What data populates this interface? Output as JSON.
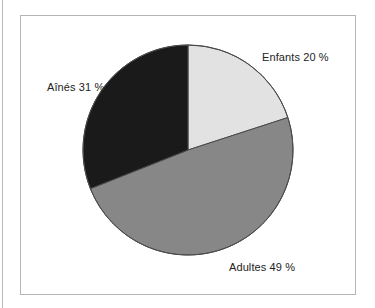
{
  "figure": {
    "frame_color": "#b5b5b5",
    "background_color": "#ffffff"
  },
  "chart_data": {
    "type": "pie",
    "title": "",
    "subtitle": "",
    "xlabel": "",
    "ylabel": "",
    "legend_position": "none",
    "grid": false,
    "units": "%",
    "start_angle_deg": 0,
    "direction": "clockwise",
    "center": {
      "x": 188,
      "y": 150
    },
    "radius": 105,
    "categories": [
      "Enfants",
      "Adultes",
      "Aînés"
    ],
    "values": [
      20,
      49,
      31
    ],
    "labels": [
      "Enfants 20 %",
      "Adultes 49 %",
      "Aînés 31 %"
    ],
    "colors": [
      "#e2e2e2",
      "#878787",
      "#1a1a1a"
    ],
    "slice_border_color": "#4a4a4a",
    "slices": [
      {
        "name": "Enfants",
        "value": 20,
        "label": "Enfants 20 %",
        "color": "#e2e2e2",
        "start_angle_deg": 0,
        "end_angle_deg": 72
      },
      {
        "name": "Adultes",
        "value": 49,
        "label": "Adultes 49 %",
        "color": "#878787",
        "start_angle_deg": 72,
        "end_angle_deg": 248.4
      },
      {
        "name": "Aînés",
        "value": 31,
        "label": "Aînés 31 %",
        "color": "#1a1a1a",
        "start_angle_deg": 248.4,
        "end_angle_deg": 360
      }
    ]
  }
}
